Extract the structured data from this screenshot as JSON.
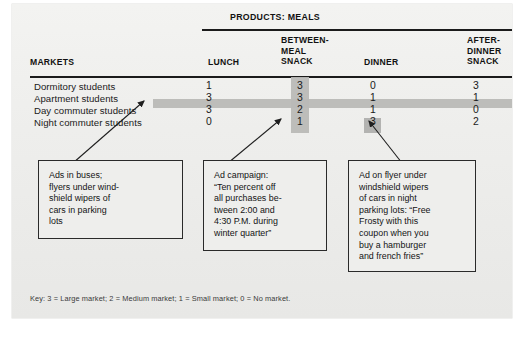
{
  "figure": {
    "products_title": "PRODUCTS: MEALS",
    "markets_header": "MARKETS",
    "key": "Key: 3 = Large market; 2 = Medium market; 1 = Small market; 0 = No market."
  },
  "table": {
    "row_header_label": "MARKETS",
    "columns": [
      {
        "label": "LUNCH"
      },
      {
        "label": "BETWEEN-\nMEAL\nSNACK"
      },
      {
        "label": "DINNER"
      },
      {
        "label": "AFTER-\nDINNER\nSNACK"
      }
    ],
    "rows": [
      {
        "label": "Dormitory students",
        "values": [
          "1",
          "3",
          "0",
          "3"
        ]
      },
      {
        "label": "Apartment students",
        "values": [
          "3",
          "3",
          "1",
          "1"
        ]
      },
      {
        "label": "Day commuter students",
        "values": [
          "3",
          "2",
          "1",
          "0"
        ]
      },
      {
        "label": "Night commuter students",
        "values": [
          "0",
          "1",
          "3",
          "2"
        ]
      }
    ]
  },
  "notes": [
    {
      "text": "Ads in buses;\nflyers under wind-\nshield wipers of\ncars in parking\nlots"
    },
    {
      "text": "Ad campaign:\n“Ten percent off\nall purchases be-\ntween 2:00 and\n4:30 P.M. during\nwinter quarter”"
    },
    {
      "text": "Ad on flyer under\nwindshield wipers\nof cars in night\nparking lots: “Free\nFrosty with this\ncoupon when you\nbuy a hamburger\nand french fries”"
    }
  ],
  "colors": {
    "panel_bg": "#ececea",
    "highlight": "#b9b9b7",
    "rule": "#1b1b1b",
    "text": "#1a1a1a"
  }
}
